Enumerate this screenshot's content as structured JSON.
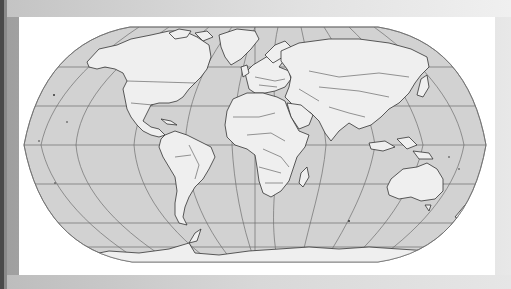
{
  "figure": {
    "type": "world-map",
    "projection": "Robinson",
    "colors": {
      "background_dark_strip": "#4a4a4a",
      "background_gray": "#b9b9b9",
      "frame": "#ffffff",
      "ocean": "#d2d2d2",
      "land": "#efefef",
      "borders": "#333333",
      "graticule": "#6e6e6e"
    },
    "graticule": {
      "parallels_deg": [
        -60,
        -30,
        0,
        30,
        60
      ],
      "meridians_deg": [
        -150,
        -120,
        -90,
        -60,
        -30,
        0,
        30,
        60,
        90,
        120,
        150
      ]
    },
    "continents": [
      "North America",
      "South America",
      "Europe",
      "Africa",
      "Asia",
      "Australia",
      "Antarctica",
      "Greenland"
    ]
  }
}
